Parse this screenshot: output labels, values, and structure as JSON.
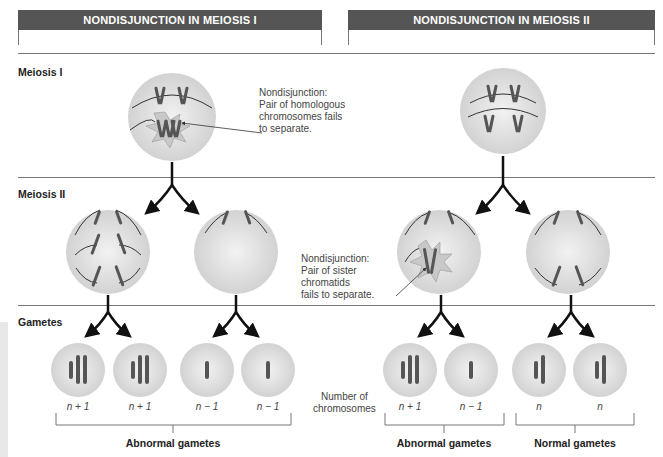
{
  "headers": {
    "left": "NONDISJUNCTION IN MEIOSIS I",
    "right": "NONDISJUNCTION IN MEIOSIS II"
  },
  "rows": {
    "meiosis1": "Meiosis I",
    "meiosis2": "Meiosis II",
    "gametes": "Gametes"
  },
  "annotations": {
    "meiosis1_note": [
      "Nondisjunction:",
      "Pair of homologous",
      "chromosomes fails",
      "to separate."
    ],
    "meiosis2_note": [
      "Nondisjunction:",
      "Pair of sister",
      "chromatids",
      "fails to separate."
    ],
    "number_of_chromosomes": [
      "Number of",
      "chromosomes"
    ]
  },
  "gametes": [
    {
      "label": "n + 1",
      "group": "left"
    },
    {
      "label": "n + 1",
      "group": "left"
    },
    {
      "label": "n − 1",
      "group": "left"
    },
    {
      "label": "n − 1",
      "group": "left"
    },
    {
      "label": "n + 1",
      "group": "right-abnormal"
    },
    {
      "label": "n − 1",
      "group": "right-abnormal"
    },
    {
      "label": "n",
      "group": "right-normal"
    },
    {
      "label": "n",
      "group": "right-normal"
    }
  ],
  "groups": {
    "left_abnormal": "Abnormal gametes",
    "right_abnormal": "Abnormal gametes",
    "right_normal": "Normal gametes"
  },
  "colors": {
    "header_bg": "#555555",
    "cell_fill": "#d9d9d9",
    "chromosome": "#555555",
    "star": "#c8c8c8"
  }
}
